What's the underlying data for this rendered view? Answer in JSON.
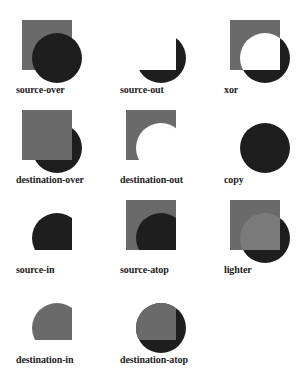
{
  "colors": {
    "square": "#6a6a6a",
    "circle": "#1e1e1e",
    "lighter_overlap": "#7a7a7a",
    "background": "#ffffff"
  },
  "operations": [
    {
      "label": "source-over"
    },
    {
      "label": "source-out"
    },
    {
      "label": "xor"
    },
    {
      "label": "destination-over"
    },
    {
      "label": "destination-out"
    },
    {
      "label": "copy"
    },
    {
      "label": "source-in"
    },
    {
      "label": "source-atop"
    },
    {
      "label": "lighter"
    },
    {
      "label": "destination-in"
    },
    {
      "label": "destination-atop"
    }
  ]
}
